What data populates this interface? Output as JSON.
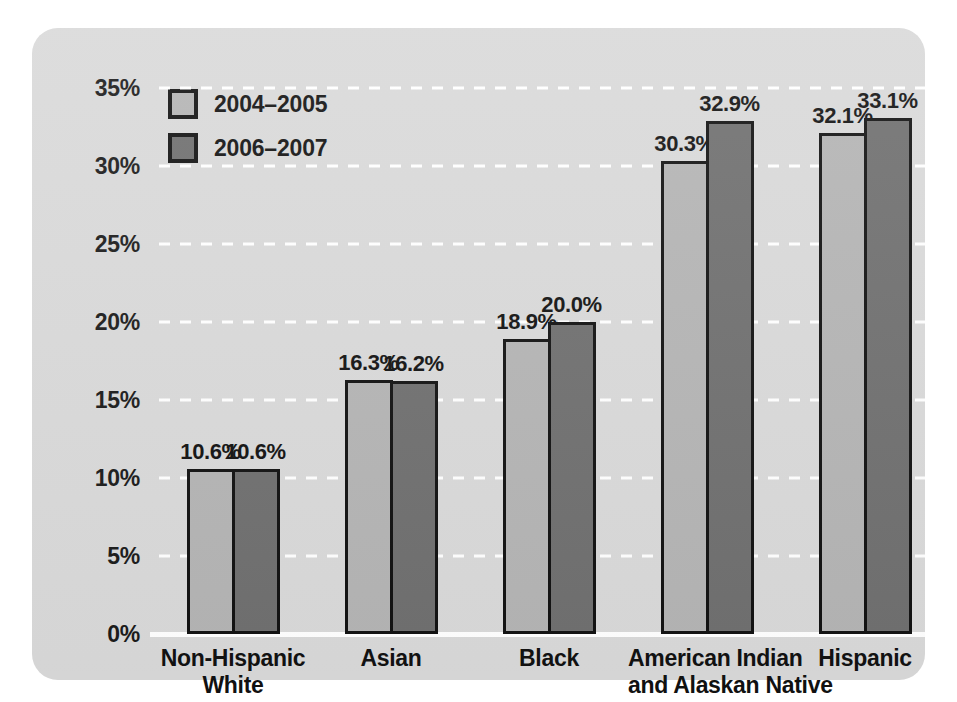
{
  "chart_data": {
    "type": "bar",
    "title": "",
    "subtitle": "",
    "xlabel": "",
    "ylabel": "",
    "ylim": [
      0,
      35
    ],
    "ytick_values": [
      35,
      30,
      25,
      20,
      15,
      10,
      5,
      0
    ],
    "ytick_labels": [
      "35%",
      "30%",
      "25%",
      "20%",
      "15%",
      "10%",
      "5%",
      "0%"
    ],
    "grid": "horizontal-dotted-white",
    "legend_position": "top-left-inside",
    "categories": [
      "Non-Hispanic\nWhite",
      "Asian",
      "Black",
      "American Indian\nand Alaskan Native",
      "Hispanic"
    ],
    "category_lines": [
      [
        "Non-Hispanic",
        "White"
      ],
      [
        "Asian"
      ],
      [
        "Black"
      ],
      [
        "American Indian",
        "and Alaskan Native"
      ],
      [
        "Hispanic"
      ]
    ],
    "series": [
      {
        "name": "2004–2005",
        "color": "#b4b4b4",
        "values": [
          10.6,
          16.3,
          18.9,
          30.3,
          32.1
        ],
        "labels": [
          "10.6%",
          "16.3%",
          "18.9%",
          "30.3%",
          "32.1%"
        ]
      },
      {
        "name": "2006–2007",
        "color": "#6f6f6f",
        "values": [
          10.6,
          16.2,
          20.0,
          32.9,
          33.1
        ],
        "labels": [
          "10.6%",
          "16.2%",
          "20.0%",
          "32.9%",
          "33.1%"
        ]
      }
    ]
  },
  "legend": {
    "items": [
      {
        "label": "2004–2005",
        "color": "#b4b4b4"
      },
      {
        "label": "2006–2007",
        "color": "#6f6f6f"
      }
    ]
  },
  "colors": {
    "panel_background": "#d9d9d9",
    "page_background": "#ffffff",
    "series_2004_2005": "#b4b4b4",
    "series_2006_2007": "#6f6f6f",
    "bar_outline": "#111111",
    "gridline": "#ffffff",
    "text": "#111111"
  }
}
